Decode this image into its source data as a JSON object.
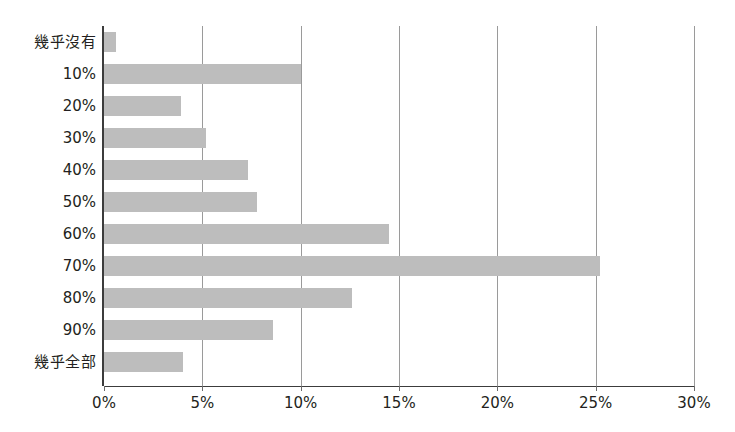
{
  "chart_data": {
    "type": "bar",
    "orientation": "horizontal",
    "title": "",
    "xlabel": "",
    "ylabel": "",
    "grid": true,
    "legend": false,
    "xlim": [
      0,
      30
    ],
    "xticks": [
      "0%",
      "5%",
      "10%",
      "15%",
      "20%",
      "25%",
      "30%"
    ],
    "xtick_values": [
      0,
      5,
      10,
      15,
      20,
      25,
      30
    ],
    "categories": [
      "幾乎沒有",
      "10%",
      "20%",
      "30%",
      "40%",
      "50%",
      "60%",
      "70%",
      "80%",
      "90%",
      "幾乎全部"
    ],
    "values": [
      0.6,
      10.0,
      3.9,
      5.2,
      7.3,
      7.8,
      14.5,
      25.2,
      12.6,
      8.6,
      4.0
    ],
    "series": [
      {
        "name": "比例",
        "values": [
          0.6,
          10.0,
          3.9,
          5.2,
          7.3,
          7.8,
          14.5,
          25.2,
          12.6,
          8.6,
          4.0
        ]
      }
    ]
  },
  "colors": {
    "bar_fill": "#bdbdbd",
    "gridline": "#9a9a9a",
    "axis": "#3c3c3c",
    "text": "#231f20",
    "background": "#ffffff"
  }
}
